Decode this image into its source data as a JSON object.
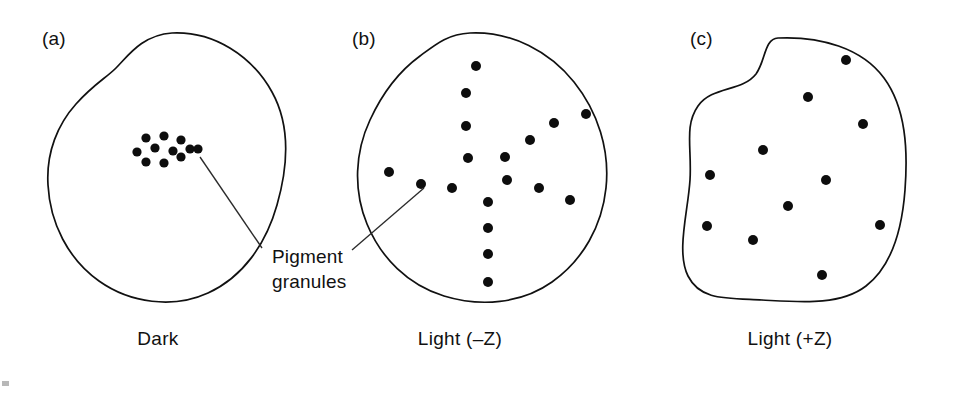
{
  "figure": {
    "background_color": "#ffffff",
    "outline_color": "#111111",
    "granule_color": "#0d0d0d",
    "leader_color": "#2b2b2b"
  },
  "annotation": {
    "label_line_1": "Pigment",
    "label_line_2": "granules",
    "target_panels": [
      "a",
      "b"
    ]
  },
  "panels": [
    {
      "id": "a",
      "label": "(a)",
      "caption": "Dark",
      "granule_count": 11,
      "distribution": "aggregated",
      "label_x": 42,
      "label_y": 45,
      "caption_x": 158,
      "caption_y": 345,
      "outline_path": "M 172,33 C 214,31 252,56 272,92 C 292,128 287,170 277,205 C 266,244 243,277 208,293 C 173,309 130,303 99,281 C 68,259 50,223 48,185 C 46,152 58,124 76,104 C 94,84 106,78 116,68 C 128,56 142,35 172,33 Z",
      "granules": [
        {
          "cx": 146,
          "cy": 138
        },
        {
          "cx": 164,
          "cy": 136
        },
        {
          "cx": 181,
          "cy": 140
        },
        {
          "cx": 137,
          "cy": 152
        },
        {
          "cx": 155,
          "cy": 148
        },
        {
          "cx": 173,
          "cy": 151
        },
        {
          "cx": 190,
          "cy": 149
        },
        {
          "cx": 146,
          "cy": 162
        },
        {
          "cx": 164,
          "cy": 163
        },
        {
          "cx": 181,
          "cy": 157
        },
        {
          "cx": 198,
          "cy": 149
        }
      ]
    },
    {
      "id": "b",
      "label": "(b)",
      "caption": "Light (–Z)",
      "granule_count": 17,
      "distribution": "dispersed",
      "label_x": 352,
      "label_y": 45,
      "caption_x": 460,
      "caption_y": 345,
      "outline_path": "M 470,33 C 512,31 550,52 574,82 C 598,112 610,150 606,188 C 602,226 583,260 552,282 C 521,304 480,307 444,296 C 408,285 381,258 367,224 C 353,190 355,152 370,120 C 382,94 398,72 420,56 C 436,44 448,34 470,33 Z",
      "granules": [
        {
          "cx": 476,
          "cy": 66
        },
        {
          "cx": 466,
          "cy": 93
        },
        {
          "cx": 466,
          "cy": 126
        },
        {
          "cx": 468,
          "cy": 158
        },
        {
          "cx": 554,
          "cy": 123
        },
        {
          "cx": 586,
          "cy": 114
        },
        {
          "cx": 530,
          "cy": 140
        },
        {
          "cx": 505,
          "cy": 157
        },
        {
          "cx": 507,
          "cy": 180
        },
        {
          "cx": 539,
          "cy": 188
        },
        {
          "cx": 570,
          "cy": 200
        },
        {
          "cx": 389,
          "cy": 172
        },
        {
          "cx": 421,
          "cy": 184
        },
        {
          "cx": 452,
          "cy": 188
        },
        {
          "cx": 488,
          "cy": 202
        },
        {
          "cx": 488,
          "cy": 228
        },
        {
          "cx": 488,
          "cy": 254
        },
        {
          "cx": 488,
          "cy": 282
        }
      ]
    },
    {
      "id": "c",
      "label": "(c)",
      "caption": "Light (+Z)",
      "granule_count": 11,
      "distribution": "dispersed",
      "label_x": 690,
      "label_y": 45,
      "caption_x": 790,
      "caption_y": 345,
      "outline_path": "M 778,38 C 820,36 862,48 884,78 C 906,108 908,150 905,190 C 902,230 892,266 866,286 C 840,306 800,302 762,300 C 724,298 700,300 688,276 C 676,252 688,212 690,180 C 692,148 684,126 698,106 C 712,86 742,92 756,74 C 766,60 764,39 778,38 Z",
      "granules": [
        {
          "cx": 846,
          "cy": 60
        },
        {
          "cx": 808,
          "cy": 97
        },
        {
          "cx": 863,
          "cy": 124
        },
        {
          "cx": 763,
          "cy": 150
        },
        {
          "cx": 710,
          "cy": 175
        },
        {
          "cx": 826,
          "cy": 180
        },
        {
          "cx": 788,
          "cy": 206
        },
        {
          "cx": 707,
          "cy": 226
        },
        {
          "cx": 753,
          "cy": 240
        },
        {
          "cx": 880,
          "cy": 225
        },
        {
          "cx": 822,
          "cy": 275
        }
      ]
    }
  ],
  "leaders": [
    {
      "from_panel": "a",
      "x1": 200,
      "y1": 157,
      "x2": 262,
      "y2": 248
    },
    {
      "from_panel": "b",
      "x1": 424,
      "y1": 188,
      "x2": 352,
      "y2": 250
    }
  ]
}
